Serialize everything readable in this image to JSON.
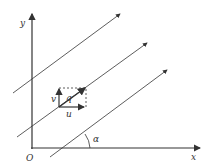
{
  "diagram": {
    "labels": {
      "y_axis": "y",
      "x_axis": "x",
      "origin": "O",
      "velocity": "q",
      "v_component": "v",
      "u_component": "u",
      "angle": "α"
    },
    "colors": {
      "stroke": "#333333",
      "background": "#ffffff"
    }
  }
}
